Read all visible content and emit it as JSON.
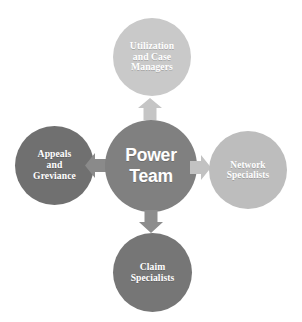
{
  "diagram": {
    "title": "Power Team",
    "center": {
      "id": "power-team",
      "label": "Power\nTeam",
      "color": "#808080",
      "text_color": "#ffffff"
    },
    "nodes": [
      {
        "id": "utilization-and-case-managers",
        "position": "top",
        "label": "Utilization\nand Case\nManagers",
        "color": "#c9c9c9",
        "text_color": "#ffffff"
      },
      {
        "id": "appeals-and-greviance",
        "position": "left",
        "label": "Appeals\nand\nGreviance",
        "color": "#707070",
        "text_color": "#ffffff"
      },
      {
        "id": "network-specialists",
        "position": "right",
        "label": "Network\nSpecialists",
        "color": "#bdbdbd",
        "text_color": "#ffffff"
      },
      {
        "id": "claim-specialists",
        "position": "bottom",
        "label": "Claim\nSpecialists",
        "color": "#767676",
        "text_color": "#ffffff"
      }
    ],
    "arrows": [
      {
        "id": "arrow-up",
        "direction": "up",
        "from": "power-team",
        "to": "utilization-and-case-managers",
        "color": "#c5c5c5"
      },
      {
        "id": "arrow-left",
        "direction": "left",
        "from": "power-team",
        "to": "appeals-and-greviance",
        "color": "#8a8a8a"
      },
      {
        "id": "arrow-right",
        "direction": "right",
        "from": "power-team",
        "to": "network-specialists",
        "color": "#c2c2c2"
      },
      {
        "id": "arrow-down",
        "direction": "down",
        "from": "power-team",
        "to": "claim-specialists",
        "color": "#8d8d8d"
      }
    ],
    "background": "#ffffff"
  }
}
